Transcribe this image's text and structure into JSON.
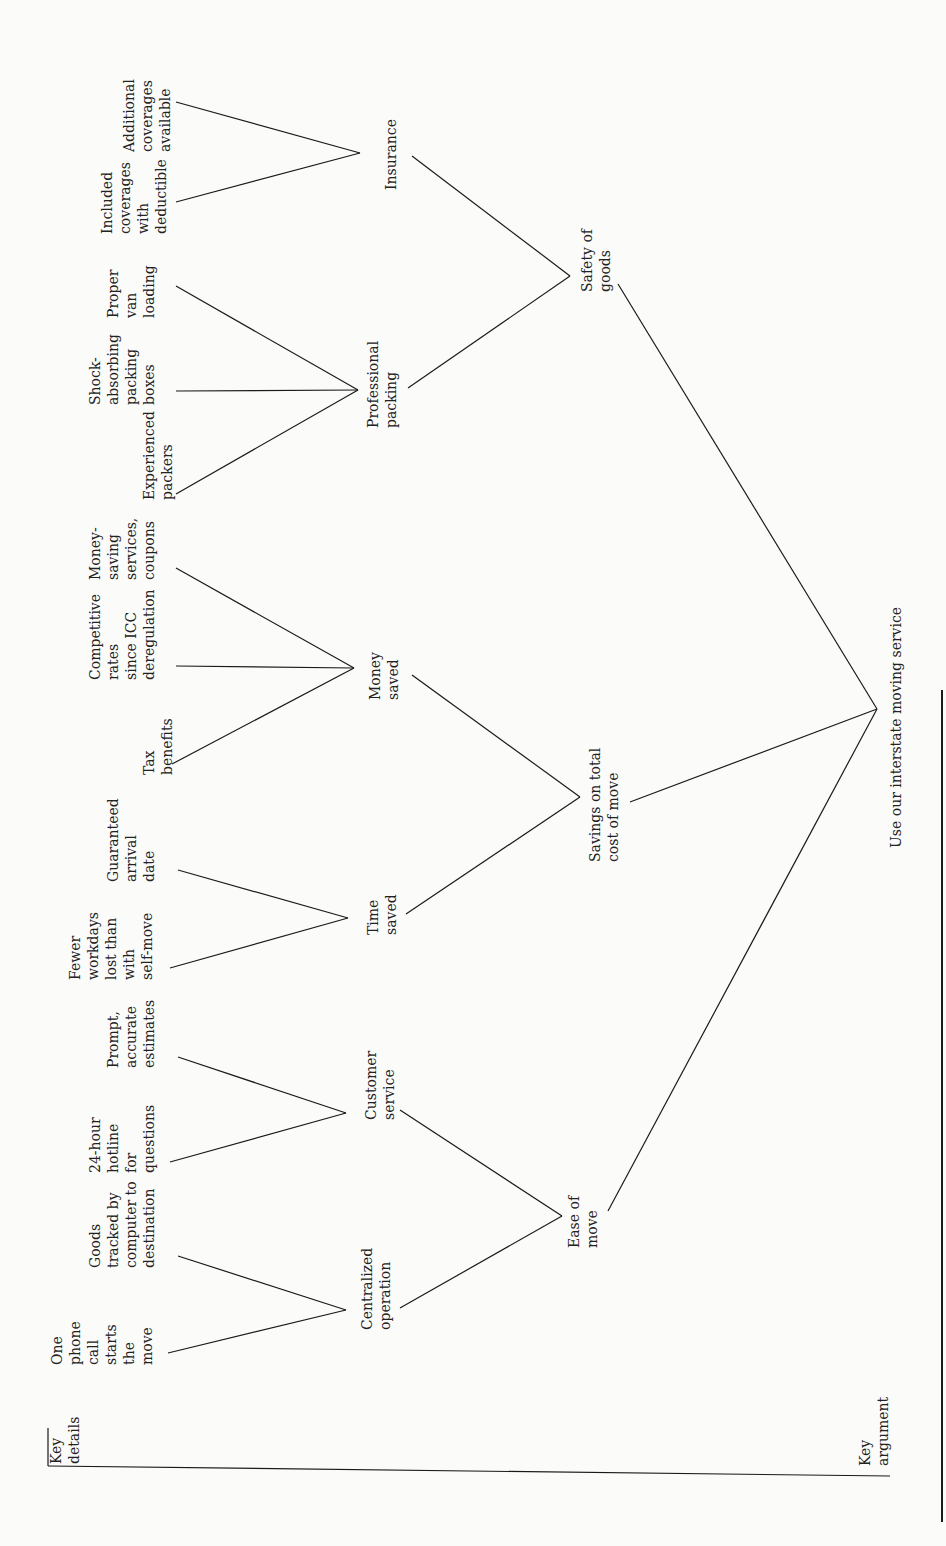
{
  "diagram": {
    "type": "argument-tree",
    "orientation": "rotated-90-ccw",
    "line_color": "#1a1a1a",
    "text_color": "#222222",
    "background": "#fbfbf9",
    "axis_labels": {
      "key_details": "Key\ndetails",
      "key_argument": "Key\nargument"
    },
    "root": {
      "id": "root",
      "label": "Use our interstate moving service"
    },
    "arguments": [
      {
        "id": "ease",
        "label": "Ease of\nmove"
      },
      {
        "id": "savings",
        "label": "Savings on total\ncost of move"
      },
      {
        "id": "safety",
        "label": "Safety of\ngoods"
      }
    ],
    "sub_arguments": [
      {
        "id": "central",
        "parent": "ease",
        "label": "Centralized\noperation"
      },
      {
        "id": "custserv",
        "parent": "ease",
        "label": "Customer\nservice"
      },
      {
        "id": "time",
        "parent": "savings",
        "label": "Time\nsaved"
      },
      {
        "id": "money",
        "parent": "savings",
        "label": "Money\nsaved"
      },
      {
        "id": "packing",
        "parent": "safety",
        "label": "Professional\npacking"
      },
      {
        "id": "insurance",
        "parent": "safety",
        "label": "Insurance"
      }
    ],
    "details": [
      {
        "id": "d1",
        "parent": "central",
        "label": "One\nphone\ncall\nstarts\nthe\nmove"
      },
      {
        "id": "d2",
        "parent": "central",
        "label": "Goods\ntracked by\ncomputer to\ndestination"
      },
      {
        "id": "d3",
        "parent": "custserv",
        "label": "24-hour\nhotline\nfor\nquestions"
      },
      {
        "id": "d4",
        "parent": "custserv",
        "label": "Prompt,\naccurate\nestimates"
      },
      {
        "id": "d5",
        "parent": "time",
        "label": "Fewer\nworkdays\nlost than\nwith\nself-move"
      },
      {
        "id": "d6",
        "parent": "time",
        "label": "Guaranteed\narrival\ndate"
      },
      {
        "id": "d7",
        "parent": "money",
        "label": "Tax\nbenefits"
      },
      {
        "id": "d8",
        "parent": "money",
        "label": "Competitive\nrates\nsince ICC\nderegulation"
      },
      {
        "id": "d9",
        "parent": "money",
        "label": "Money-\nsaving\nservices,\ncoupons"
      },
      {
        "id": "d10",
        "parent": "packing",
        "label": "Experienced\npackers"
      },
      {
        "id": "d11",
        "parent": "packing",
        "label": "Shock-\nabsorbing\npacking\nboxes"
      },
      {
        "id": "d12",
        "parent": "packing",
        "label": "Proper\nvan\nloading"
      },
      {
        "id": "d13",
        "parent": "insurance",
        "label": "Included\ncoverages\nwith\ndeductible"
      },
      {
        "id": "d14",
        "parent": "insurance",
        "label": "Additional\ncoverages\navailable"
      }
    ]
  }
}
